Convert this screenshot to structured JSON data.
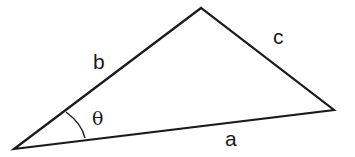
{
  "diagram": {
    "type": "triangle",
    "vertices": {
      "left": [
        14,
        149
      ],
      "top": [
        201,
        8
      ],
      "right": [
        334,
        110
      ]
    },
    "labels": {
      "side_a": "a",
      "side_b": "b",
      "side_c": "c",
      "angle": "θ"
    },
    "colors": {
      "stroke": "#1a1a1a",
      "background": "#ffffff"
    }
  }
}
